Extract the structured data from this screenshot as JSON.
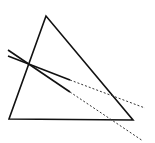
{
  "diagram": {
    "width": 155,
    "height": 143,
    "background": "#ffffff",
    "stroke_color": "#111111",
    "triangle": {
      "points": "46,16 9,119 133,120"
    },
    "lines": [
      {
        "name": "upper-line",
        "solid": {
          "x1": 8,
          "y1": 56,
          "x2": 70,
          "y2": 80
        },
        "dotted": {
          "x1": 70,
          "y1": 80,
          "x2": 145,
          "y2": 108
        }
      },
      {
        "name": "lower-line",
        "solid": {
          "x1": 8,
          "y1": 50,
          "x2": 70,
          "y2": 92
        },
        "dotted": {
          "x1": 70,
          "y1": 92,
          "x2": 143,
          "y2": 141
        }
      }
    ]
  }
}
